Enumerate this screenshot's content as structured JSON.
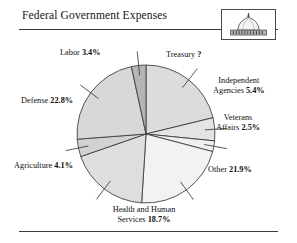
{
  "header": {
    "title": "Federal Government Expenses",
    "logo_name": "capitol-dome-icon"
  },
  "chart_data": {
    "type": "pie",
    "title": "Federal Government Expenses",
    "unit": "percent",
    "legend": "none",
    "labels_inline": true,
    "note": "Treasury share is unlabeled and shown as a question mark",
    "categories": [
      "Treasury",
      "Independent Agencies",
      "Veterans Affairs",
      "Other",
      "Health and Human Services",
      "Agriculture",
      "Defense",
      "Labor"
    ],
    "values": [
      21.2,
      5.4,
      2.5,
      21.9,
      18.7,
      4.1,
      22.8,
      3.4
    ],
    "value_labels": [
      "?",
      "5.4%",
      "2.5%",
      "21.9%",
      "18.7%",
      "4.1%",
      "22.8%",
      "3.4%"
    ],
    "slice_colors": [
      "#dcdcdc",
      "#e4e4e4",
      "#f0f0f0",
      "#f2f2f2",
      "#dedede",
      "#d2d2d2",
      "#d8d8d8",
      "#b4b4b4"
    ],
    "stroke_color": "#3a3a3a",
    "background": "#ffffff"
  },
  "labels": {
    "labor": {
      "name": "Labor",
      "value": "3.4%"
    },
    "treasury": {
      "name": "Treasury",
      "value": "?"
    },
    "independent": {
      "line1": "Independent",
      "name": "Agencies",
      "value": "5.4%"
    },
    "veterans": {
      "line1": "Veterans",
      "name": "Affairs",
      "value": "2.5%"
    },
    "other": {
      "name": "Other",
      "value": "21.9%"
    },
    "defense": {
      "name": "Defense",
      "value": "22.8%"
    },
    "agriculture": {
      "name": "Agriculture",
      "value": "4.1%"
    },
    "hhs": {
      "line1": "Health and Human",
      "name": "Services",
      "value": "18.7%"
    }
  }
}
